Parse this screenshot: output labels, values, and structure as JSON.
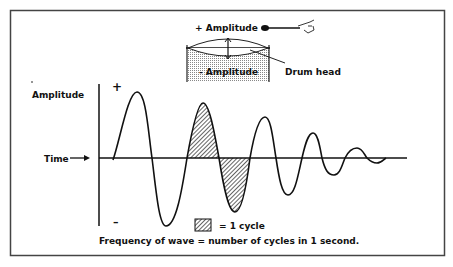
{
  "diagram": {
    "drum": {
      "plus_amplitude_label": "+ Amplitude",
      "minus_amplitude_label": "- Amplitude",
      "drum_head_label": "Drum head"
    },
    "wave_graph": {
      "y_axis_label": "Amplitude",
      "x_axis_label": "Time",
      "plus_sign": "+",
      "minus_sign": "–",
      "legend_label": "= 1 cycle",
      "caption": "Frequency of wave = number of cycles in 1 second.",
      "description": "Damped oscillation: amplitude decreases over successive cycles; one full cycle is shaded",
      "shaded_cycle_index": 2
    },
    "colors": {
      "ink": "#111111",
      "background": "#ffffff",
      "drum_shading": "#d8d8d8"
    }
  }
}
